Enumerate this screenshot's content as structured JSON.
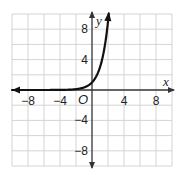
{
  "chart_data": {
    "type": "line",
    "title": "",
    "xlabel": "x",
    "ylabel": "y",
    "origin_label": "O",
    "xlim": [
      -10,
      10
    ],
    "ylim": [
      -10,
      10
    ],
    "grid": true,
    "grid_step": 2,
    "x_ticks": [
      -8,
      -4,
      4,
      8
    ],
    "y_ticks": [
      8,
      4,
      -4,
      -8
    ],
    "x_tick_labels": [
      "−8",
      "−4",
      "4",
      "8"
    ],
    "y_tick_labels": [
      "8",
      "4",
      "−4",
      "−8"
    ],
    "series": [
      {
        "name": "exponential curve",
        "function": "y = 3^x",
        "x": [
          -10,
          -8,
          -6,
          -4,
          -2,
          -1,
          0,
          1,
          1.5,
          2,
          2.1
        ],
        "values": [
          0,
          0,
          0,
          0.01,
          0.11,
          0.33,
          1,
          3,
          5.2,
          9,
          10
        ],
        "arrow_left": true,
        "arrow_right": true
      }
    ],
    "colors": {
      "grid": "#d4d4d4",
      "axis": "#333333",
      "curve": "#111111",
      "background": "#ffffff"
    }
  }
}
